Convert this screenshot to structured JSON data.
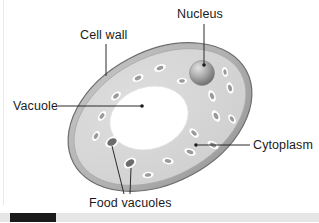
{
  "figure": {
    "background_color": "#ffffff"
  },
  "labels": {
    "cell_wall": "Cell wall",
    "nucleus": "Nucleus",
    "vacuole": "Vacuole",
    "cytoplasm": "Cytoplasm",
    "food_vacuoles": "Food vacuoles"
  },
  "colors": {
    "outline": "#6d6d6d",
    "cell_wall_band": "#b4b4b4",
    "cytoplasm_fill": "#d6d6d6",
    "vacuole_fill": "#ffffff",
    "organelle_rim": "#ffffff",
    "organelle_core": "#9a9a9a",
    "food_vacuole_core": "#6b6b6b",
    "nucleus_light": "#d8d8d8",
    "nucleus_dark": "#6f6f6f",
    "leader_line": "#2a2a2a",
    "text": "#1b1b1b",
    "scrollbar_track": "#e6e6e6",
    "scrollbar_thumb": "#1a1a1a"
  },
  "cell": {
    "center_x": 160,
    "center_y": 117,
    "radius_x": 98,
    "radius_y": 66,
    "rotation_deg": -28,
    "wall_thickness": 6
  },
  "vacuole": {
    "center_x": 149,
    "center_y": 118,
    "radius_x": 40,
    "radius_y": 31,
    "rotation_deg": -18
  },
  "nucleus": {
    "center_x": 202,
    "center_y": 73,
    "radius": 12
  },
  "organelles": [
    {
      "x": 138,
      "y": 78,
      "rx": 6.0,
      "ry": 3.4,
      "rot": -25,
      "kind": "organelle"
    },
    {
      "x": 160,
      "y": 68,
      "rx": 6.2,
      "ry": 3.4,
      "rot": -22,
      "kind": "organelle"
    },
    {
      "x": 116,
      "y": 96,
      "rx": 5.8,
      "ry": 3.3,
      "rot": -40,
      "kind": "organelle"
    },
    {
      "x": 102,
      "y": 116,
      "rx": 5.6,
      "ry": 3.2,
      "rot": -55,
      "kind": "organelle"
    },
    {
      "x": 96,
      "y": 136,
      "rx": 5.4,
      "ry": 3.2,
      "rot": -60,
      "kind": "organelle"
    },
    {
      "x": 112,
      "y": 142,
      "rx": 7.2,
      "ry": 5.0,
      "rot": -30,
      "kind": "food-vacuole"
    },
    {
      "x": 130,
      "y": 163,
      "rx": 6.8,
      "ry": 4.6,
      "rot": -35,
      "kind": "food-vacuole"
    },
    {
      "x": 148,
      "y": 175,
      "rx": 5.6,
      "ry": 3.2,
      "rot": -8,
      "kind": "organelle"
    },
    {
      "x": 168,
      "y": 161,
      "rx": 5.8,
      "ry": 3.3,
      "rot": 10,
      "kind": "organelle"
    },
    {
      "x": 190,
      "y": 152,
      "rx": 6.0,
      "ry": 3.4,
      "rot": 20,
      "kind": "organelle"
    },
    {
      "x": 194,
      "y": 133,
      "rx": 5.8,
      "ry": 3.3,
      "rot": 45,
      "kind": "organelle"
    },
    {
      "x": 213,
      "y": 145,
      "rx": 6.0,
      "ry": 3.4,
      "rot": 30,
      "kind": "organelle"
    },
    {
      "x": 216,
      "y": 116,
      "rx": 6.2,
      "ry": 3.6,
      "rot": 62,
      "kind": "organelle"
    },
    {
      "x": 212,
      "y": 96,
      "rx": 6.0,
      "ry": 3.4,
      "rot": 70,
      "kind": "organelle"
    },
    {
      "x": 232,
      "y": 119,
      "rx": 5.2,
      "ry": 3.0,
      "rot": 55,
      "kind": "organelle"
    },
    {
      "x": 230,
      "y": 88,
      "rx": 5.8,
      "ry": 3.4,
      "rot": 75,
      "kind": "organelle"
    },
    {
      "x": 225,
      "y": 72,
      "rx": 5.0,
      "ry": 3.0,
      "rot": 80,
      "kind": "organelle"
    },
    {
      "x": 182,
      "y": 81,
      "rx": 5.2,
      "ry": 3.0,
      "rot": -5,
      "kind": "organelle"
    }
  ],
  "leaders": {
    "cell_wall": {
      "path": "M 106 44 L 106 75",
      "dot": null
    },
    "nucleus": {
      "path": "M 204 24 L 204 65",
      "dot": {
        "x": 204,
        "y": 66
      }
    },
    "vacuole": {
      "path": "M 58 106 L 141 106",
      "dot": {
        "x": 142,
        "y": 106
      }
    },
    "cytoplasm": {
      "path": "M 250 145 L 198 145",
      "dot": {
        "x": 196,
        "y": 145
      }
    },
    "food_vacuole_1": {
      "path": "M 124 194 L 112 146",
      "dot": null
    },
    "food_vacuole_2": {
      "path": "M 130 194 L 130 168",
      "dot": null
    }
  },
  "scrollbar": {
    "thumb_left": 10,
    "thumb_width": 46
  }
}
